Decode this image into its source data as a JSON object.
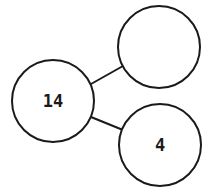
{
  "diagram": {
    "type": "number-bond",
    "whole": {
      "label": "14",
      "cx": 53,
      "cy": 101,
      "r": 41
    },
    "parts": [
      {
        "label": "",
        "cx": 159,
        "cy": 47,
        "r": 41
      },
      {
        "label": "4",
        "cx": 160,
        "cy": 145,
        "r": 41
      }
    ],
    "colors": {
      "stroke": "#1a1a1a",
      "fill": "#ffffff"
    }
  }
}
